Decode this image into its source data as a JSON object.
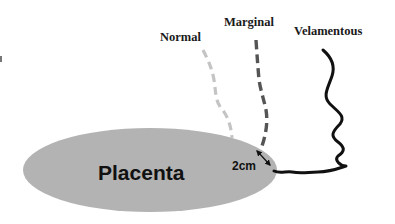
{
  "diagram": {
    "placenta": {
      "label": "Placenta",
      "fill_color": "#b3b3b3"
    },
    "cords": [
      {
        "label": "Normal",
        "insertion": "central",
        "style": "dashed",
        "color": "#c4c4c4"
      },
      {
        "label": "Marginal",
        "insertion": "margin",
        "style": "dashed",
        "color": "#555555"
      },
      {
        "label": "Velamentous",
        "insertion": "membranes",
        "style": "solid-wavy",
        "color": "#111111"
      }
    ],
    "distance_marker": {
      "label": "2cm",
      "type": "double-headed-arrow"
    }
  }
}
